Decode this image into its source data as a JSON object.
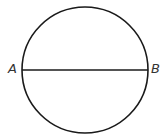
{
  "diagram": {
    "type": "geometry",
    "circle": {
      "cx": 85,
      "cy": 70,
      "r": 63,
      "stroke": "#1a1a1a",
      "stroke_width": 1.6
    },
    "diameter": {
      "x1": 22,
      "y1": 70,
      "x2": 148,
      "y2": 70,
      "stroke": "#1a1a1a",
      "stroke_width": 1.6
    },
    "points": [
      {
        "label": "A",
        "x": 22,
        "y": 70
      },
      {
        "label": "B",
        "x": 148,
        "y": 70
      }
    ]
  }
}
